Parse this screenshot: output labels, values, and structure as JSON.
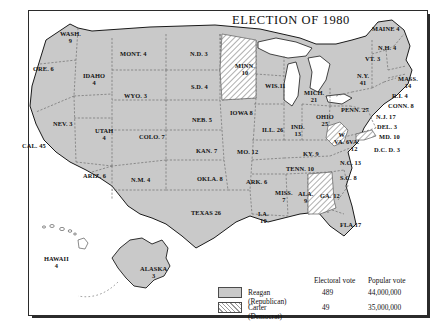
{
  "title": "ELECTION OF 1980",
  "legend": {
    "col_electoral": "Electoral vote",
    "col_popular": "Popular vote",
    "rows": [
      {
        "swatch": "solid-gray",
        "name": "Reagan (Republican)",
        "electoral": "489",
        "popular": "44,000,000"
      },
      {
        "swatch": "hatched",
        "name": "Carter (Democrat)",
        "electoral": "49",
        "popular": "35,000,000"
      }
    ]
  },
  "chart_data": {
    "type": "map",
    "title": "ELECTION OF 1980",
    "legend_position": "bottom-right",
    "series": [
      {
        "name": "Reagan (Republican)",
        "fill": "#c9c9c9",
        "electoral_vote": 489,
        "popular_vote": 44000000
      },
      {
        "name": "Carter (Democrat)",
        "fill": "hatched",
        "electoral_vote": 49,
        "popular_vote": 35000000
      }
    ],
    "categories": [
      "WASH.",
      "ORE.",
      "CAL.",
      "IDAHO",
      "NEV.",
      "UTAH",
      "ARIZ.",
      "MONT.",
      "WYO.",
      "COLO.",
      "N.M.",
      "N.D.",
      "S.D.",
      "NEB.",
      "KAN.",
      "OKLA.",
      "TEXAS",
      "MINN.",
      "IOWA",
      "MO.",
      "ARK.",
      "LA.",
      "WIS.",
      "ILL.",
      "MICH.",
      "IND.",
      "OHIO",
      "KY.",
      "TENN.",
      "MISS.",
      "ALA.",
      "GA.",
      "FLA.",
      "S.C.",
      "N.C.",
      "VA.",
      "W. VA.",
      "MD.",
      "DEL.",
      "D.C.",
      "PENN.",
      "N.J.",
      "N.Y.",
      "CONN.",
      "R.I.",
      "MASS.",
      "VT.",
      "N.H.",
      "MAINE",
      "ALASKA",
      "HAWAII"
    ],
    "values": [
      9,
      6,
      45,
      4,
      3,
      4,
      6,
      4,
      3,
      7,
      4,
      3,
      4,
      5,
      7,
      8,
      26,
      10,
      8,
      12,
      6,
      10,
      11,
      26,
      21,
      13,
      25,
      9,
      10,
      7,
      9,
      12,
      17,
      8,
      13,
      12,
      6,
      10,
      3,
      3,
      27,
      17,
      41,
      8,
      4,
      14,
      3,
      4,
      4,
      3,
      4
    ],
    "winners": [
      "R",
      "R",
      "R",
      "R",
      "R",
      "R",
      "R",
      "R",
      "R",
      "R",
      "R",
      "R",
      "R",
      "R",
      "R",
      "R",
      "R",
      "D",
      "R",
      "R",
      "R",
      "R",
      "R",
      "R",
      "R",
      "R",
      "R",
      "R",
      "R",
      "R",
      "R",
      "D",
      "R",
      "R",
      "R",
      "R",
      "D",
      "D",
      "R",
      "D",
      "R",
      "R",
      "R",
      "R",
      "R",
      "R",
      "R",
      "R",
      "R",
      "R",
      "R"
    ]
  },
  "states": [
    {
      "name": "WASH.",
      "votes": "9",
      "x": 60,
      "y": 30,
      "party": "rep"
    },
    {
      "name": "ORE. 6",
      "votes": "",
      "x": 33,
      "y": 65,
      "party": "rep"
    },
    {
      "name": "CAL. 45",
      "votes": "",
      "x": 22,
      "y": 142,
      "party": "rep"
    },
    {
      "name": "IDAHO",
      "votes": "4",
      "x": 83,
      "y": 72,
      "party": "rep"
    },
    {
      "name": "NEV. 3",
      "votes": "",
      "x": 53,
      "y": 120,
      "party": "rep"
    },
    {
      "name": "UTAH",
      "votes": "4",
      "x": 95,
      "y": 127,
      "party": "rep"
    },
    {
      "name": "ARIZ. 6",
      "votes": "",
      "x": 83,
      "y": 172,
      "party": "rep"
    },
    {
      "name": "MONT. 4",
      "votes": "",
      "x": 120,
      "y": 50,
      "party": "rep"
    },
    {
      "name": "WYO. 3",
      "votes": "",
      "x": 124,
      "y": 92,
      "party": "rep"
    },
    {
      "name": "COLO. 7",
      "votes": "",
      "x": 139,
      "y": 133,
      "party": "rep"
    },
    {
      "name": "N.M. 4",
      "votes": "",
      "x": 131,
      "y": 176,
      "party": "rep"
    },
    {
      "name": "N.D. 3",
      "votes": "",
      "x": 190,
      "y": 50,
      "party": "rep"
    },
    {
      "name": "S.D. 4",
      "votes": "",
      "x": 191,
      "y": 83,
      "party": "rep"
    },
    {
      "name": "NEB. 5",
      "votes": "",
      "x": 192,
      "y": 116,
      "party": "rep"
    },
    {
      "name": "KAN. 7",
      "votes": "",
      "x": 196,
      "y": 147,
      "party": "rep"
    },
    {
      "name": "OKLA. 8",
      "votes": "",
      "x": 197,
      "y": 175,
      "party": "rep"
    },
    {
      "name": "TEXAS 26",
      "votes": "",
      "x": 191,
      "y": 209,
      "party": "rep"
    },
    {
      "name": "MINN.",
      "votes": "10",
      "x": 235,
      "y": 62,
      "party": "dem"
    },
    {
      "name": "IOWA 8",
      "votes": "",
      "x": 230,
      "y": 109,
      "party": "rep"
    },
    {
      "name": "MO. 12",
      "votes": "",
      "x": 237,
      "y": 148,
      "party": "rep"
    },
    {
      "name": "ARK. 6",
      "votes": "",
      "x": 246,
      "y": 178,
      "party": "rep"
    },
    {
      "name": "LA.",
      "votes": "10",
      "x": 258,
      "y": 210,
      "party": "rep"
    },
    {
      "name": "WIS.11",
      "votes": "",
      "x": 265,
      "y": 82,
      "party": "rep"
    },
    {
      "name": "ILL. 26",
      "votes": "",
      "x": 262,
      "y": 126,
      "party": "rep"
    },
    {
      "name": "MICH.",
      "votes": "21",
      "x": 304,
      "y": 89,
      "party": "rep"
    },
    {
      "name": "IND.",
      "votes": "13",
      "x": 291,
      "y": 123,
      "party": "rep"
    },
    {
      "name": "OHIO",
      "votes": "25",
      "x": 316,
      "y": 113,
      "party": "rep"
    },
    {
      "name": "KY. 9",
      "votes": "",
      "x": 303,
      "y": 150,
      "party": "rep"
    },
    {
      "name": "TENN. 10",
      "votes": "",
      "x": 286,
      "y": 165,
      "party": "rep"
    },
    {
      "name": "MISS.",
      "votes": "7",
      "x": 275,
      "y": 189,
      "party": "rep"
    },
    {
      "name": "ALA.",
      "votes": "9",
      "x": 298,
      "y": 190,
      "party": "rep"
    },
    {
      "name": "GA. 12",
      "votes": "",
      "x": 320,
      "y": 192,
      "party": "dem"
    },
    {
      "name": "FLA.17",
      "votes": "",
      "x": 340,
      "y": 221,
      "party": "rep"
    },
    {
      "name": "S.C. 8",
      "votes": "",
      "x": 340,
      "y": 174,
      "party": "rep"
    },
    {
      "name": "N.C. 13",
      "votes": "",
      "x": 340,
      "y": 159,
      "party": "rep"
    },
    {
      "name": "VA.",
      "votes": "12",
      "x": 349,
      "y": 138,
      "party": "rep"
    },
    {
      "name": "W",
      "votes": "VA. 6",
      "x": 334,
      "y": 131,
      "party": "dem"
    },
    {
      "name": "MD. 10",
      "votes": "",
      "x": 379,
      "y": 133,
      "party": "rep"
    },
    {
      "name": "DEL. 3",
      "votes": "",
      "x": 377,
      "y": 123,
      "party": "rep"
    },
    {
      "name": "D.C. D. 3",
      "votes": "",
      "x": 374,
      "y": 146,
      "party": "dem"
    },
    {
      "name": "PENN. 27",
      "votes": "",
      "x": 341,
      "y": 106,
      "party": "rep"
    },
    {
      "name": "N.J. 17",
      "votes": "",
      "x": 376,
      "y": 113,
      "party": "rep"
    },
    {
      "name": "N.Y.",
      "votes": "41",
      "x": 357,
      "y": 72,
      "party": "rep"
    },
    {
      "name": "CONN. 8",
      "votes": "",
      "x": 388,
      "y": 102,
      "party": "rep"
    },
    {
      "name": "R.I. 4",
      "votes": "",
      "x": 392,
      "y": 92,
      "party": "rep"
    },
    {
      "name": "MASS.",
      "votes": "14",
      "x": 398,
      "y": 75,
      "party": "rep"
    },
    {
      "name": "VT. 3",
      "votes": "",
      "x": 365,
      "y": 55,
      "party": "rep"
    },
    {
      "name": "N.H. 4",
      "votes": "",
      "x": 378,
      "y": 44,
      "party": "rep"
    },
    {
      "name": "MAINE 4",
      "votes": "",
      "x": 372,
      "y": 25,
      "party": "rep"
    },
    {
      "name": "ALASKA",
      "votes": "3",
      "x": 140,
      "y": 265,
      "party": "rep"
    },
    {
      "name": "HAWAII",
      "votes": "4",
      "x": 44,
      "y": 255,
      "party": "rep"
    }
  ]
}
